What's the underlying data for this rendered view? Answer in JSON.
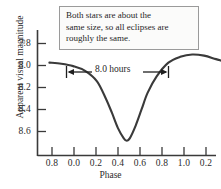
{
  "chart_data": {
    "type": "line",
    "title": "",
    "xlabel": "Phase",
    "ylabel": "Apparent visual magnitude",
    "xlim": [
      0.7,
      1.3
    ],
    "ylim": [
      8.75,
      7.72
    ],
    "y_axis_inverted": true,
    "grid": false,
    "legend": "none",
    "x_tick_labels": [
      "0.8",
      "0.0",
      "0.2",
      "0.4",
      "0.6",
      "0.8",
      "1.0",
      "0.2"
    ],
    "x_tick_positions": [
      0.8,
      1.0,
      1.2,
      1.4,
      1.6,
      1.8,
      2.0,
      2.2
    ],
    "y_tick_labels": [
      "7.8",
      "8.0",
      "8.2",
      "8.4",
      "8.6"
    ],
    "y_tick_values": [
      7.8,
      8.0,
      8.2,
      8.4,
      8.6
    ],
    "series": [
      {
        "name": "Light curve",
        "color": "#3a3a3a",
        "x": [
          0.74,
          0.78,
          0.82,
          0.86,
          0.9,
          0.93,
          0.95,
          0.97,
          0.99,
          1.0,
          1.01,
          1.03,
          1.05,
          1.07,
          1.1,
          1.14,
          1.18,
          1.22,
          1.26,
          1.3,
          1.34,
          1.38,
          1.42,
          1.45,
          1.47,
          1.49,
          1.5,
          1.51,
          1.53,
          1.55,
          1.58,
          1.62,
          1.66,
          1.7,
          1.74,
          1.78,
          1.82,
          1.86,
          1.9,
          1.94,
          1.97,
          1.99,
          2.0,
          2.01,
          2.03,
          2.06,
          2.1,
          2.14,
          2.18,
          2.22
        ],
        "y": [
          8.0,
          8.01,
          8.03,
          8.07,
          8.16,
          8.31,
          8.43,
          8.56,
          8.65,
          8.67,
          8.65,
          8.54,
          8.4,
          8.26,
          8.12,
          8.0,
          7.95,
          7.93,
          7.94,
          7.97,
          8.0,
          8.02,
          8.08,
          8.22,
          8.38,
          8.54,
          8.6,
          8.56,
          8.42,
          8.26,
          8.12,
          8.02,
          7.99,
          7.97,
          7.95,
          7.94,
          7.96,
          8.0,
          8.09,
          8.26,
          8.45,
          8.6,
          8.65,
          8.62,
          8.48,
          8.28,
          8.12,
          8.04,
          8.0,
          7.97
        ]
      }
    ],
    "eclipse_minima": [
      {
        "phase": 0.0,
        "magnitude": 8.67,
        "type": "primary"
      },
      {
        "phase": 0.5,
        "magnitude": 8.6,
        "type": "secondary"
      },
      {
        "phase": 1.0,
        "magnitude": 8.65,
        "type": "primary"
      }
    ],
    "annotations": [
      {
        "name": "period-marker",
        "label": "8.0 hours",
        "from_phase": 1.0,
        "to_phase": 2.0,
        "style": "double-headed-arrow"
      },
      {
        "name": "explanation-box",
        "lines": [
          "Both stars are about the",
          "same size, so all eclipses are",
          "roughly the same."
        ]
      }
    ]
  },
  "axes": {
    "xlabel": "Phase",
    "ylabel": "Apparent visual magnitude",
    "y_ticks": [
      {
        "label": "7.8"
      },
      {
        "label": "8.0"
      },
      {
        "label": "8.2"
      },
      {
        "label": "8.4"
      },
      {
        "label": "8.6"
      }
    ],
    "x_ticks": [
      {
        "label": "0.8"
      },
      {
        "label": "0.0"
      },
      {
        "label": "0.2"
      },
      {
        "label": "0.4"
      },
      {
        "label": "0.6"
      },
      {
        "label": "0.8"
      },
      {
        "label": "1.0"
      },
      {
        "label": "0.2"
      }
    ]
  },
  "annotation": {
    "line1": "Both stars are about the",
    "line2": "same size, so all eclipses are",
    "line3": "roughly the same."
  },
  "period": {
    "label": "8.0 hours"
  },
  "colors": {
    "curve": "#3a3a3a",
    "axis": "#3a3a3a",
    "box_border": "#9a9a9a",
    "text": "#2b2b2b",
    "background": "#ffffff"
  }
}
